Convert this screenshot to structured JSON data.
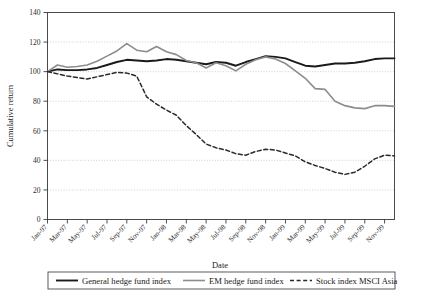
{
  "chart_data": {
    "type": "line",
    "title": "",
    "xlabel": "Date",
    "ylabel": "Cumulative return",
    "ylim": [
      0,
      140
    ],
    "ytick_values": [
      0,
      20,
      40,
      60,
      80,
      100,
      120,
      140
    ],
    "ytick_labels": [
      "0",
      "20",
      "40",
      "60",
      "80",
      "100",
      "120",
      "140"
    ],
    "grid": true,
    "grid_axis": "y",
    "legend_position": "bottom",
    "x": [
      "Jan-97",
      "Feb-97",
      "Mar-97",
      "Apr-97",
      "May-97",
      "Jun-97",
      "Jul-97",
      "Aug-97",
      "Sep-97",
      "Oct-97",
      "Nov-97",
      "Dec-97",
      "Jan-98",
      "Feb-98",
      "Mar-98",
      "Apr-98",
      "May-98",
      "Jun-98",
      "Jul-98",
      "Aug-98",
      "Sep-98",
      "Oct-98",
      "Nov-98",
      "Dec-98",
      "Jan-99",
      "Feb-99",
      "Mar-99",
      "Apr-99",
      "May-99",
      "Jun-99",
      "Jul-99",
      "Aug-99",
      "Sep-99",
      "Oct-99",
      "Nov-99",
      "Dec-99"
    ],
    "xtick_labels": [
      "Jan-97",
      "Mar-97",
      "May-97",
      "Jul-97",
      "Sep-97",
      "Nov-97",
      "Jan-98",
      "Mar-98",
      "May-98",
      "Jul-98",
      "Sep-98",
      "Nov-98",
      "Jan-99",
      "Mar-99",
      "May-99",
      "Jul-99",
      "Sep-99",
      "Nov-99"
    ],
    "series": [
      {
        "name": "General hedge fund index",
        "color": "#1a1a1a",
        "style": "solid",
        "width": 1.9,
        "values": [
          100.0,
          101.5,
          101.0,
          101.0,
          101.5,
          102.5,
          104.5,
          106.5,
          108.0,
          107.5,
          107.0,
          107.5,
          108.5,
          108.0,
          107.0,
          106.0,
          105.0,
          106.5,
          106.0,
          104.0,
          106.5,
          108.5,
          110.5,
          110.0,
          109.0,
          106.5,
          104.0,
          103.5,
          104.5,
          105.5,
          105.5,
          106.0,
          107.0,
          108.5,
          109.0,
          109.0
        ]
      },
      {
        "name": "EM hedge fund index",
        "color": "#8c8c8c",
        "style": "solid",
        "width": 1.6,
        "values": [
          100.0,
          104.5,
          103.0,
          103.5,
          104.5,
          107.0,
          110.5,
          114.0,
          119.0,
          114.5,
          113.5,
          117.0,
          113.5,
          111.5,
          107.5,
          106.0,
          102.5,
          106.0,
          104.0,
          100.5,
          105.0,
          108.0,
          110.0,
          108.5,
          105.5,
          100.5,
          95.5,
          88.5,
          88.0,
          80.0,
          77.0,
          75.5,
          75.0,
          77.0,
          77.0,
          76.5
        ]
      },
      {
        "name": "Stock index MSCI Asia",
        "color": "#2a2a2a",
        "style": "dashed",
        "width": 1.5,
        "values": [
          100.0,
          98.5,
          97.0,
          96.0,
          95.0,
          96.5,
          98.0,
          99.5,
          99.0,
          97.0,
          83.0,
          78.0,
          74.0,
          70.5,
          63.5,
          57.5,
          51.0,
          48.5,
          47.0,
          44.5,
          43.5,
          46.0,
          47.5,
          47.0,
          45.0,
          43.0,
          39.0,
          36.5,
          34.5,
          32.0,
          30.5,
          32.0,
          36.0,
          41.0,
          43.5,
          43.0
        ]
      }
    ]
  },
  "legend": {
    "items": [
      {
        "label": "General hedge fund index",
        "style": "solid",
        "color": "#1a1a1a"
      },
      {
        "label": "EM hedge fund index",
        "style": "solid",
        "color": "#8c8c8c"
      },
      {
        "label": "Stock index MSCI Asia",
        "style": "dashed",
        "color": "#2a2a2a"
      }
    ]
  },
  "axes": {
    "x_title": "Date",
    "y_title": "Cumulative return"
  }
}
